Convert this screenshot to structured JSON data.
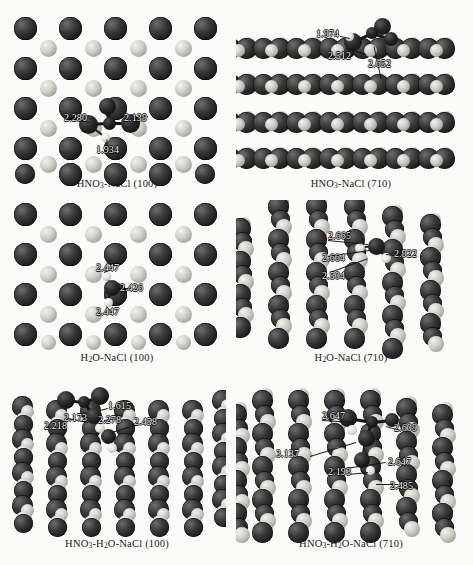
{
  "figure": {
    "type": "molecular-structure-figure",
    "panel_count": 6,
    "colors": {
      "chlorine": "#1d1d1d",
      "sodium": "#d2d2cb",
      "oxygen": "#2b2b2b",
      "nitrogen": "#242424",
      "hydrogen": "#e6e6e0",
      "background": "#fbfbf9",
      "label_text": "#f2f2f2"
    }
  },
  "panels": [
    {
      "id": "hno3-nacl-100",
      "caption_html": "HNO<sub>3</sub>-NaCl (100)",
      "view": "top-view",
      "surface": "NaCl (100)",
      "adsorbate": "HNO3",
      "distances": [
        "2.280",
        "2.139",
        "1.934"
      ]
    },
    {
      "id": "hno3-nacl-710",
      "caption_html": "HNO<sub>3</sub>-NaCl (710)",
      "view": "side-view",
      "surface": "NaCl (710)",
      "adsorbate": "HNO3",
      "distances": [
        "1.974",
        "2.512",
        "2.652"
      ]
    },
    {
      "id": "h2o-nacl-100",
      "caption_html": "H<sub>2</sub>O-NaCl (100)",
      "view": "top-view",
      "surface": "NaCl (100)",
      "adsorbate": "H2O",
      "distances": [
        "2.447",
        "2.426",
        "2.447"
      ]
    },
    {
      "id": "h2o-nacl-710",
      "caption_html": "H<sub>2</sub>O-NaCl (710)",
      "view": "side-view",
      "surface": "NaCl (710)",
      "adsorbate": "H2O",
      "distances": [
        "2.665",
        "2.664",
        "2.922",
        "2.504"
      ]
    },
    {
      "id": "hno3-h2o-nacl-100",
      "caption_html": "HNO<sub>3</sub>-H<sub>2</sub>O-NaCl (100)",
      "view": "side-view",
      "surface": "NaCl (100)",
      "adsorbate": "HNO3-H2O",
      "distances": [
        "1.615",
        "2.173",
        "2.218",
        "2.278",
        "2.458"
      ]
    },
    {
      "id": "hno3-h2o-nacl-710",
      "caption_html": "HNO<sub>3</sub>-H<sub>2</sub>O-NaCl (710)",
      "view": "side-view",
      "surface": "NaCl (710)",
      "adsorbate": "HNO3-H2O",
      "distances": [
        "2.647",
        "2.609",
        "3.137",
        "2.647",
        "2.193",
        "2.485"
      ]
    }
  ],
  "distance_labels": {
    "p1": {
      "d1": "2.280",
      "d2": "2.139",
      "d3": "1.934"
    },
    "p2": {
      "d1": "1.974",
      "d2": "2.512",
      "d3": "2.652"
    },
    "p3": {
      "d1": "2.447",
      "d2": "2.426",
      "d3": "2.447"
    },
    "p4": {
      "d1": "2.665",
      "d2": "2.664",
      "d3": "2.922",
      "d4": "2.504"
    },
    "p5": {
      "d1": "1.615",
      "d2": "2.173",
      "d3": "2.218",
      "d4": "2.278",
      "d5": "2.458"
    },
    "p6": {
      "d1": "2.647",
      "d2": "2.609",
      "d3": "3.137",
      "d4": "2.647",
      "d5": "2.193",
      "d6": "2.485"
    }
  }
}
